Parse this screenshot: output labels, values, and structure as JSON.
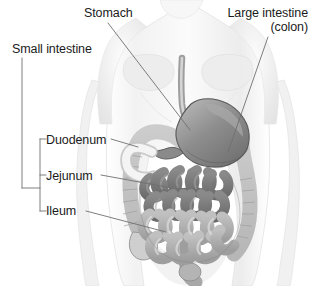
{
  "figure": {
    "background_color": "#ffffff",
    "width": 312,
    "height": 286
  },
  "labels": {
    "stomach": "Stomach",
    "large_intestine_line1": "Large intestine",
    "large_intestine_line2": "(colon)",
    "small_intestine": "Small intestine",
    "duodenum": "Duodenum",
    "jejunum": "Jejunum",
    "ileum": "Ileum"
  },
  "colors": {
    "leader_line": "#6f6f6f",
    "text": "#1b1b1b",
    "body_outline": "#d8d8d8",
    "body_fill": "#f4f4f4",
    "stomach_fill": "#8d8d8d",
    "stomach_outline": "#555555",
    "colon_fill": "#d2d2d2",
    "colon_outline": "#8a8a8a",
    "jejunum_fill": "#7a7a7a",
    "ileum_fill": "#b0b0b0",
    "intestine_outline": "#4a4a4a"
  },
  "structures": [
    {
      "name": "stomach",
      "label": "Stomach",
      "shade": "dark-gray"
    },
    {
      "name": "large-intestine",
      "label": "Large intestine (colon)",
      "shade": "light-gray"
    },
    {
      "name": "duodenum",
      "label": "Duodenum",
      "shade": "very-light-gray"
    },
    {
      "name": "jejunum",
      "label": "Jejunum",
      "shade": "dark-gray"
    },
    {
      "name": "ileum",
      "label": "Ileum",
      "shade": "medium-gray"
    },
    {
      "name": "esophagus",
      "label": "Esophagus",
      "shade": "light-gray"
    },
    {
      "name": "rectum",
      "label": "Rectum",
      "shade": "medium-gray"
    }
  ]
}
